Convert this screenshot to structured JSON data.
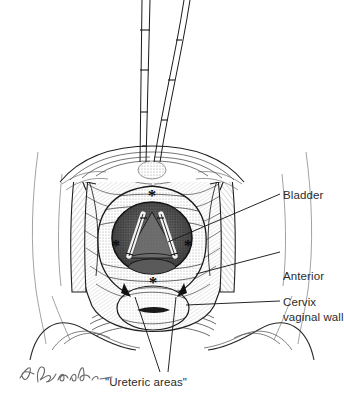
{
  "figure": {
    "kind": "medical-line-illustration",
    "background_color": "#ffffff",
    "ink_color": "#1a1a1a",
    "label_color": "#2b2b2b"
  },
  "labels": {
    "bladder": "Bladder",
    "anterior_vaginal_wall_line1": "Anterior",
    "anterior_vaginal_wall_line2": "vaginal wall",
    "cervix": "Cervix",
    "ureteric_areas": "\"Ureteric areas\""
  },
  "markers": {
    "asterisk": "*",
    "asterisk_count": 4,
    "asterisk_note": "asterisks ring the vaginal cuff incision margin"
  },
  "instruments": {
    "count": 2,
    "note": "two long shafted instruments entering from top of field"
  },
  "signature": {
    "artist_mark": "L. Vaskalis",
    "style": "handwritten cursive"
  }
}
